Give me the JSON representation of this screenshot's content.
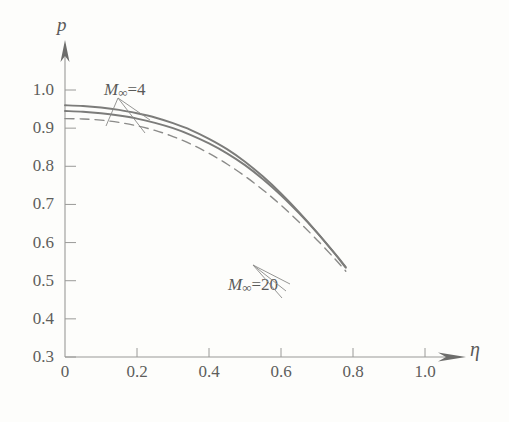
{
  "chart_data": {
    "type": "line",
    "title": "",
    "xlabel": "η",
    "ylabel": "p",
    "xlim": [
      0,
      1.12
    ],
    "ylim": [
      0.3,
      1.04
    ],
    "grid": false,
    "legend_position": "inline-annotations",
    "xticks": [
      "0",
      "0.2",
      "0.4",
      "0.6",
      "0.8",
      "1.0"
    ],
    "xtick_values": [
      0,
      0.2,
      0.4,
      0.6,
      0.8,
      1.0
    ],
    "yticks": [
      "0.3",
      "0.4",
      "0.5",
      "0.6",
      "0.7",
      "0.8",
      "0.9",
      "1.0"
    ],
    "ytick_values": [
      0.3,
      0.4,
      0.5,
      0.6,
      0.7,
      0.8,
      0.9,
      1.0
    ],
    "series": [
      {
        "name": "upper-solid",
        "style": "solid",
        "color": "#7c7c7a",
        "x": [
          0.0,
          0.05,
          0.1,
          0.15,
          0.2,
          0.25,
          0.3,
          0.35,
          0.4,
          0.45,
          0.5,
          0.55,
          0.6,
          0.65,
          0.7,
          0.75,
          0.78
        ],
        "values": [
          0.96,
          0.958,
          0.954,
          0.948,
          0.939,
          0.928,
          0.913,
          0.895,
          0.872,
          0.845,
          0.812,
          0.773,
          0.729,
          0.68,
          0.627,
          0.57,
          0.534
        ]
      },
      {
        "name": "lower-solid",
        "style": "solid",
        "color": "#7c7c7a",
        "x": [
          0.0,
          0.05,
          0.1,
          0.15,
          0.2,
          0.25,
          0.3,
          0.35,
          0.4,
          0.45,
          0.5,
          0.55,
          0.6,
          0.65,
          0.7,
          0.75,
          0.78
        ],
        "values": [
          0.945,
          0.943,
          0.939,
          0.933,
          0.925,
          0.914,
          0.9,
          0.882,
          0.86,
          0.834,
          0.803,
          0.766,
          0.724,
          0.677,
          0.626,
          0.571,
          0.536
        ]
      },
      {
        "name": "dashed",
        "style": "dashed",
        "color": "#8b8b89",
        "x": [
          0.0,
          0.05,
          0.1,
          0.15,
          0.2,
          0.25,
          0.3,
          0.35,
          0.4,
          0.45,
          0.5,
          0.55,
          0.6,
          0.65,
          0.7,
          0.75,
          0.78
        ],
        "values": [
          0.925,
          0.924,
          0.921,
          0.915,
          0.906,
          0.894,
          0.878,
          0.858,
          0.834,
          0.806,
          0.774,
          0.738,
          0.698,
          0.654,
          0.607,
          0.557,
          0.525
        ]
      }
    ],
    "annotations": [
      {
        "name": "m-infinity-4",
        "math_prefix": "M",
        "subscript": "∞",
        "equals_value": "=4",
        "text": "M∞=4",
        "x": 0.18,
        "y": 0.99
      },
      {
        "name": "m-infinity-20",
        "math_prefix": "M",
        "subscript": "∞",
        "equals_value": "=20",
        "text": "M∞=20",
        "x": 0.53,
        "y": 0.49
      }
    ]
  },
  "axes": {
    "y_axis_letter": "p",
    "x_axis_letter": "η"
  }
}
